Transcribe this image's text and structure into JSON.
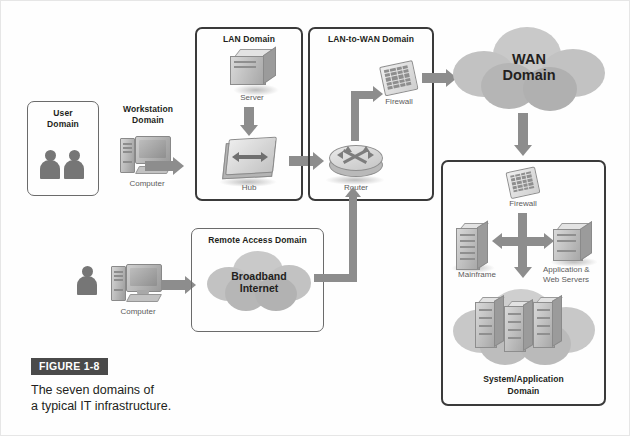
{
  "figure": {
    "badge": "FIGURE 1-8",
    "caption_line1": "The seven domains of",
    "caption_line2": "a typical IT infrastructure."
  },
  "colors": {
    "arrow": "#8d8d8d",
    "box_border": "#4d4d4d",
    "badge_bg": "#4a4a4a",
    "text": "#231f20",
    "caption_text": "#5b5b5b",
    "cloud_fill": "#bfbfbf"
  },
  "domains": {
    "user": {
      "title_line1": "User",
      "title_line2": "Domain"
    },
    "workstation": {
      "title_line1": "Workstation",
      "title_line2": "Domain",
      "device_label": "Computer"
    },
    "lan": {
      "title": "LAN Domain",
      "server_label": "Server",
      "hub_label": "Hub"
    },
    "lan_to_wan": {
      "title": "LAN-to-WAN Domain",
      "firewall_label": "Firewall",
      "router_label": "Router"
    },
    "wan": {
      "title_line1": "WAN",
      "title_line2": "Domain"
    },
    "remote_access": {
      "title": "Remote Access Domain",
      "cloud_line1": "Broadband",
      "cloud_line2": "Internet",
      "device_label": "Computer"
    },
    "system_application": {
      "title_line1": "System/Application",
      "title_line2": "Domain",
      "firewall_label": "Firewall",
      "mainframe_label": "Mainframe",
      "servers_label_line1": "Application &",
      "servers_label_line2": "Web Servers"
    }
  }
}
